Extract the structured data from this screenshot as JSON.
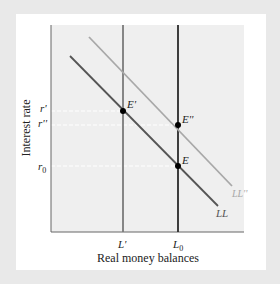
{
  "diagram": {
    "y_axis_label": "Interest rate",
    "x_axis_label": "Real money balances",
    "y_ticks": [
      {
        "label": "r'",
        "y": 111
      },
      {
        "label": "r''",
        "y": 125
      },
      {
        "label": "r0",
        "base": "r",
        "sub": "0",
        "y": 166
      }
    ],
    "x_ticks": [
      {
        "label": "L'",
        "x": 123
      },
      {
        "label": "L0",
        "base": "L",
        "sub": "0",
        "x": 178
      }
    ],
    "curves": [
      {
        "name": "LL",
        "label": "LL",
        "color": "#555555",
        "from": [
          70,
          56
        ],
        "to": [
          218,
          206
        ]
      },
      {
        "name": "LL''",
        "label": "LL''",
        "color": "#a8a8a8",
        "from": [
          89,
          37
        ],
        "to": [
          232,
          186
        ]
      }
    ],
    "vertical_lines": [
      {
        "name": "L'",
        "x": 123,
        "color": "#7a7a7a"
      },
      {
        "name": "L0",
        "x": 178,
        "color": "#2a2a2a"
      }
    ],
    "points": [
      {
        "label": "E'",
        "x": 123,
        "y": 111
      },
      {
        "label": "E''",
        "x": 178,
        "y": 125
      },
      {
        "label": "E",
        "x": 178,
        "y": 166
      }
    ],
    "colors": {
      "frame": "#e9e9e9",
      "card": "#ffffff",
      "plot_bg": "#efefef",
      "axis": "#666666"
    }
  }
}
